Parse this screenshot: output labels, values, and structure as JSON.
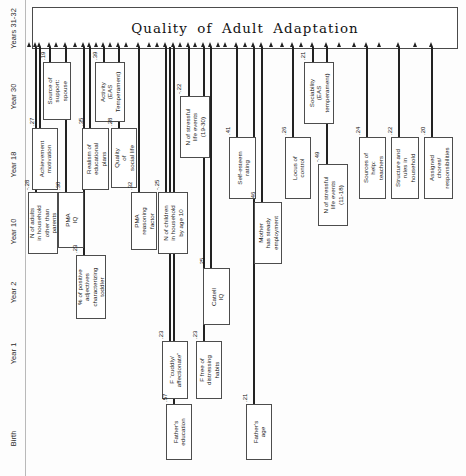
{
  "diagram": {
    "title": "Quality of Adult Adaptation",
    "type": "path-diagram",
    "axis": {
      "label_name": "year-axis",
      "labels": [
        {
          "text": "Years 31-32",
          "center_y": 30
        },
        {
          "text": "Year 30",
          "center_y": 98
        },
        {
          "text": "Year 18",
          "center_y": 166
        },
        {
          "text": "Year 10",
          "center_y": 233
        },
        {
          "text": "Year 2",
          "center_y": 294
        },
        {
          "text": "Year 1",
          "center_y": 355
        },
        {
          "text": "Birth",
          "center_y": 440
        }
      ]
    },
    "nodes": [
      {
        "id": "n1",
        "label": "N of adults\nin household\nother than\nparents",
        "coef": "-.28",
        "x": 28,
        "y": 192,
        "w": 30,
        "h": 62,
        "stem_x": 36,
        "coef_x": 24,
        "coef_y": 190
      },
      {
        "id": "n2",
        "label": "Source of\nsupport:\nspouse",
        "coef": ".19",
        "x": 43,
        "y": 62,
        "w": 28,
        "h": 58,
        "stem_x": 50,
        "coef_y": 60,
        "coef_x": 40
      },
      {
        "id": "n3",
        "label": "Achievement\nmotivation",
        "coef": ".27",
        "x": 32,
        "y": 128,
        "w": 26,
        "h": 62,
        "stem_x": 40,
        "coef_y": 126,
        "coef_x": 29
      },
      {
        "id": "n4",
        "label": "PMA\nIQ",
        "coef": ".30",
        "x": 58,
        "y": 192,
        "w": 26,
        "h": 56,
        "stem_x": 66,
        "coef_y": 190,
        "coef_x": 55
      },
      {
        "id": "n5",
        "label": "% of positive\nadjectives\ncharacterizing\ntoddler",
        "coef": ".23",
        "x": 76,
        "y": 255,
        "w": 30,
        "h": 64,
        "stem_x": 84,
        "coef_y": 253,
        "coef_x": 72
      },
      {
        "id": "n6",
        "label": "Realism of\neducational\nplans",
        "coef": ".35",
        "x": 82,
        "y": 128,
        "w": 27,
        "h": 62,
        "stem_x": 90,
        "coef_y": 126,
        "coef_x": 78
      },
      {
        "id": "n7",
        "label": "Activity\n(EAS\nTemperament)",
        "coef": ".39",
        "x": 95,
        "y": 62,
        "w": 30,
        "h": 60,
        "stem_x": 104,
        "coef_y": 60,
        "coef_x": 92
      },
      {
        "id": "n8",
        "label": "Quality\nof\nsocial life",
        "coef": ".28",
        "x": 111,
        "y": 128,
        "w": 26,
        "h": 60,
        "stem_x": 119,
        "coef_y": 126,
        "coef_x": 107
      },
      {
        "id": "n9",
        "label": "PMA\nreasoning\nfactor",
        "coef": ".32",
        "x": 131,
        "y": 192,
        "w": 26,
        "h": 58,
        "stem_x": 139,
        "coef_y": 190,
        "coef_x": 127
      },
      {
        "id": "n10",
        "label": "F “cuddly/\naffectionate”",
        "coef": ".23",
        "x": 162,
        "y": 341,
        "w": 26,
        "h": 58,
        "stem_x": 170,
        "coef_y": 339,
        "coef_x": 158
      },
      {
        "id": "n11",
        "label": "Father's\neducation",
        "coef": ".57",
        "x": 166,
        "y": 404,
        "w": 26,
        "h": 56,
        "stem_x": 174,
        "coef_y": 402,
        "coef_x": 162
      },
      {
        "id": "n12",
        "label": "N of children\nin household\nby age 10",
        "coef": "-.25",
        "x": 158,
        "y": 192,
        "w": 30,
        "h": 62,
        "stem_x": 166,
        "coef_y": 190,
        "coef_x": 154
      },
      {
        "id": "n13",
        "label": "N of stressful\nlife events\n(19-30)",
        "coef": "-.22",
        "x": 180,
        "y": 96,
        "w": 30,
        "h": 62,
        "stem_x": 189,
        "coef_y": 94,
        "coef_x": 176
      },
      {
        "id": "n14",
        "label": "F free of\ndistressing\nhabits",
        "coef": ".23",
        "x": 196,
        "y": 341,
        "w": 26,
        "h": 58,
        "stem_x": 204,
        "coef_y": 339,
        "coef_x": 192
      },
      {
        "id": "n15",
        "label": "Cattell\nIQ",
        "coef": ".25",
        "x": 203,
        "y": 268,
        "w": 27,
        "h": 57,
        "stem_x": 211,
        "coef_y": 266,
        "coef_x": 199
      },
      {
        "id": "n16",
        "label": "Father's\nage",
        "coef": ".21",
        "x": 246,
        "y": 404,
        "w": 26,
        "h": 56,
        "stem_x": 254,
        "coef_y": 402,
        "coef_x": 242
      },
      {
        "id": "n17",
        "label": "Self-esteem\nrating",
        "coef": ".41",
        "x": 229,
        "y": 137,
        "w": 27,
        "h": 62,
        "stem_x": 237,
        "coef_y": 135,
        "coef_x": 225
      },
      {
        "id": "n18",
        "label": "Mother\nhas steady\nemployment",
        "coef": ".46",
        "x": 254,
        "y": 202,
        "w": 28,
        "h": 62,
        "stem_x": 262,
        "coef_y": 200,
        "coef_x": 250
      },
      {
        "id": "n19",
        "label": "Locus of\ncontrol",
        "coef": ".26",
        "x": 285,
        "y": 137,
        "w": 26,
        "h": 62,
        "stem_x": 293,
        "coef_y": 135,
        "coef_x": 281
      },
      {
        "id": "n20",
        "label": "Sociability\n(EAS\ntemperament)",
        "coef": ".21",
        "x": 304,
        "y": 62,
        "w": 30,
        "h": 62,
        "stem_x": 313,
        "coef_y": 60,
        "coef_x": 300
      },
      {
        "id": "n21",
        "label": "N of stressful\nlife events\n(11-18)",
        "coef": "-.49",
        "x": 318,
        "y": 164,
        "w": 30,
        "h": 62,
        "stem_x": 327,
        "coef_y": 162,
        "coef_x": 314
      },
      {
        "id": "n22",
        "label": "Sources of\nhelp:\nteachers",
        "coef": ".24",
        "x": 359,
        "y": 137,
        "w": 27,
        "h": 62,
        "stem_x": 367,
        "coef_y": 135,
        "coef_x": 355
      },
      {
        "id": "n23",
        "label": "Structure and\nrules in\nhousehold",
        "coef": ".22",
        "x": 391,
        "y": 137,
        "w": 28,
        "h": 62,
        "stem_x": 399,
        "coef_y": 135,
        "coef_x": 387
      },
      {
        "id": "n24",
        "label": "Assigned\nchores/\nresponsibilities",
        "coef": ".20",
        "x": 424,
        "y": 137,
        "w": 29,
        "h": 62,
        "stem_x": 432,
        "coef_y": 135,
        "coef_x": 420
      }
    ],
    "arrow_positions": [
      30,
      36,
      40,
      50,
      57,
      66,
      76,
      84,
      90,
      97,
      104,
      111,
      119,
      127,
      139,
      150,
      158,
      166,
      174,
      181,
      189,
      196,
      204,
      211,
      219,
      226,
      237,
      246,
      254,
      262,
      272,
      283,
      293,
      302,
      313,
      327,
      340,
      355,
      367,
      380,
      399,
      416,
      432
    ]
  }
}
